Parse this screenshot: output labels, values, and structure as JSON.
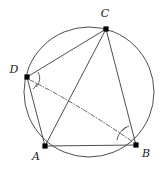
{
  "figure": {
    "background_color": "#ffffff",
    "stroke_color": "#3a3a3a",
    "point_color": "#000000",
    "label_color": "#1a1a1a"
  },
  "circle": {
    "name": "circumscribed-circle",
    "center_x": 89,
    "center_y": 92,
    "radius": 65,
    "stroke_width": 0.9
  },
  "points": [
    {
      "id": "C",
      "label": "C",
      "x": 106,
      "y": 29,
      "label_x": 105,
      "label_y": 17
    },
    {
      "id": "D",
      "label": "D",
      "x": 27,
      "y": 77,
      "label_x": 14,
      "label_y": 73
    },
    {
      "id": "A",
      "label": "A",
      "x": 45,
      "y": 146,
      "label_x": 36,
      "label_y": 160
    },
    {
      "id": "B",
      "label": "B",
      "x": 136,
      "y": 145,
      "label_x": 146,
      "label_y": 157
    }
  ],
  "segments": [
    {
      "id": "DC",
      "from": "D",
      "to": "C",
      "style": "solid"
    },
    {
      "id": "CB",
      "from": "C",
      "to": "B",
      "style": "solid"
    },
    {
      "id": "CA",
      "from": "C",
      "to": "A",
      "style": "solid"
    },
    {
      "id": "DA",
      "from": "D",
      "to": "A",
      "style": "solid"
    },
    {
      "id": "AB",
      "from": "A",
      "to": "B",
      "style": "solid"
    }
  ],
  "dashdot_curve": {
    "id": "DB",
    "from": "D",
    "to": "B",
    "style": "dash-dot",
    "path": "M 30 80 Q 78 104 133 142"
  },
  "angle_marks": [
    {
      "id": "angle-D-outer",
      "vertex": "D",
      "path": "M 38 72 A 12 12 0 0 1 36 87"
    },
    {
      "id": "angle-D-inner",
      "vertex": "D",
      "path": "M 37 83 A 11 11 0 0 1 33 89"
    },
    {
      "id": "angle-B-outer",
      "vertex": "B",
      "path": "M 117 140 A 20 20 0 0 1 126 127"
    },
    {
      "id": "angle-B-inner",
      "vertex": "B",
      "path": "M 122 131 A 16 16 0 0 1 129 126"
    }
  ]
}
